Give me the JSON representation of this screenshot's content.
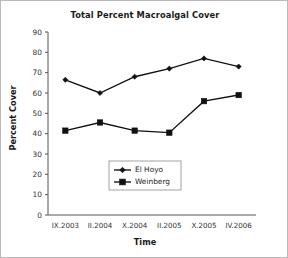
{
  "chart_data": {
    "type": "line",
    "title": "Total Percent Macroalgal Cover",
    "xlabel": "Time",
    "ylabel": "Percent Cover",
    "categories": [
      "IX.2003",
      "II.2004",
      "X.2004",
      "II.2005",
      "X.2005",
      "IV.2006"
    ],
    "ylim": [
      0,
      90
    ],
    "ytick_step": 10,
    "yticks": [
      "0",
      "10",
      "20",
      "30",
      "40",
      "50",
      "60",
      "70",
      "80",
      "90"
    ],
    "grid": false,
    "legend_position": "inside lower-center",
    "series": [
      {
        "name": "El Hoyo",
        "marker": "diamond",
        "color": "#111111",
        "values": [
          66.5,
          60,
          68,
          72,
          77,
          73
        ]
      },
      {
        "name": "Weinberg",
        "marker": "square",
        "color": "#111111",
        "values": [
          41.5,
          45.5,
          41.5,
          40.5,
          56,
          59
        ]
      }
    ]
  },
  "figure": {
    "background": "#ffffff",
    "border_color": "#b9b9b9",
    "axis_color": "#555555"
  }
}
